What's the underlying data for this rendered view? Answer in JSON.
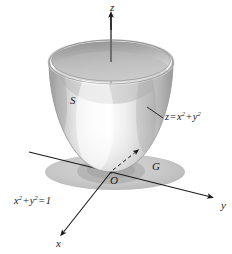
{
  "figure": {
    "background_color": "#ffffff",
    "width": 232,
    "height": 254
  },
  "axes": {
    "z": {
      "label": "z",
      "name": "z-axis",
      "orientation": "vertical-up",
      "hidden_segment": "dashed inside paraboloid"
    },
    "y": {
      "label": "y",
      "name": "y-axis",
      "orientation": "right-down"
    },
    "x": {
      "label": "x",
      "name": "x-axis",
      "orientation": "left-down"
    },
    "origin": {
      "label": "O"
    }
  },
  "labels": {
    "surface": "S",
    "region": "G",
    "surface_equation": {
      "lhs": "z",
      "eq": "=",
      "term1_base": "x",
      "term1_exp": "2",
      "plus": "+",
      "term2_base": "y",
      "term2_exp": "2"
    },
    "circle_equation": {
      "term1_base": "x",
      "term1_exp": "2",
      "plus": "+",
      "term2_base": "y",
      "term2_exp": "2",
      "eq": "=",
      "rhs": "1"
    }
  },
  "colors": {
    "stroke": "#1a1a1a",
    "surface_light": "#fdfdfd",
    "surface_mid": "#d8d8d8",
    "surface_dark": "#a8a8a8",
    "interior_shadow": "#b4b4b4",
    "disk_fill": "#c6c6c6",
    "disk_fill_dark": "#b0b0b0",
    "text": "#1a1a1a"
  },
  "geometry": {
    "rim_center": [
      111,
      62
    ],
    "rim_radius_x": 62,
    "rim_radius_y": 22,
    "vertex": [
      111,
      172
    ],
    "disk_center": [
      115,
      172
    ],
    "disk_radius_x": 70,
    "disk_radius_y": 18
  }
}
